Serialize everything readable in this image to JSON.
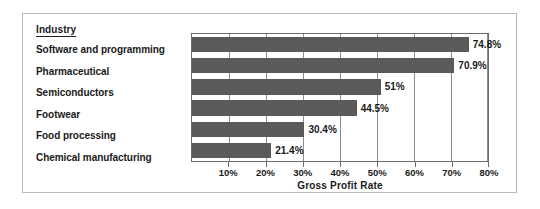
{
  "chart_data": {
    "type": "bar",
    "orientation": "horizontal",
    "title": "",
    "xlabel": "Gross Profit Rate",
    "ylabel": "Industry",
    "categories": [
      "Software and programming",
      "Pharmaceutical",
      "Semiconductors",
      "Footwear",
      "Food processing",
      "Chemical manufacturing"
    ],
    "values": [
      74.8,
      70.9,
      51,
      44.5,
      30.4,
      21.4
    ],
    "value_labels": [
      "74.8%",
      "70.9%",
      "51%",
      "44.5%",
      "30.4%",
      "21.4%"
    ],
    "xlim": [
      0,
      80
    ],
    "xticks": [
      10,
      20,
      30,
      40,
      50,
      60,
      70,
      80
    ],
    "xtick_labels": [
      "10%",
      "20%",
      "30%",
      "40%",
      "50%",
      "60%",
      "70%",
      "80%"
    ],
    "grid": true,
    "legend": false,
    "bar_color": "#5a5a5a",
    "plot_background": "#ffffff",
    "axis_color": "#6d6d6d",
    "frame_color": "#b9b9b9"
  },
  "labels": {
    "category_header": "Industry",
    "axis_title": "Gross Profit Rate"
  }
}
